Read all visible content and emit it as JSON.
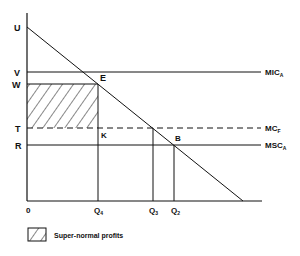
{
  "diagram": {
    "y_axis_labels": {
      "U": "U",
      "V": "V",
      "W": "W",
      "T": "T",
      "R": "R"
    },
    "x_axis_labels": {
      "origin": "0",
      "Q4": "Q",
      "Q4_sub": "4",
      "Q3": "Q",
      "Q3_sub": "3",
      "Q2": "Q",
      "Q2_sub": "2"
    },
    "points": {
      "E": "E",
      "K": "K",
      "B": "B"
    },
    "curves": {
      "mic": "MIC",
      "mic_sub": "A",
      "mcf": "MC",
      "mcf_sub": "F",
      "msc": "MSC",
      "msc_sub": "A"
    },
    "legend": {
      "label": "Super-normal profits"
    }
  }
}
